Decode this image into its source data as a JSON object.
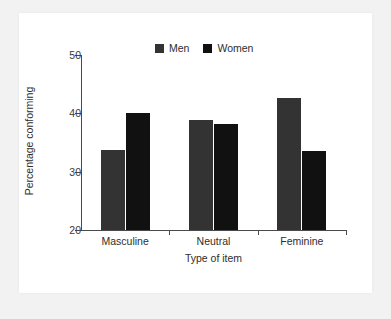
{
  "chart_data": {
    "type": "bar",
    "title": "",
    "xlabel": "Type of item",
    "ylabel": "Percentage conforming",
    "categories": [
      "Masculine",
      "Neutral",
      "Feminine"
    ],
    "series": [
      {
        "name": "Men",
        "color": "#333333",
        "values": [
          33.7,
          38.9,
          42.6
        ]
      },
      {
        "name": "Women",
        "color": "#111111",
        "values": [
          40.0,
          38.1,
          33.5
        ]
      }
    ],
    "ylim": [
      20,
      50
    ],
    "yticks": [
      20,
      30,
      40,
      50
    ],
    "ytick_labels": [
      "20",
      "30",
      "40",
      "50"
    ],
    "grid": false,
    "legend_position": "top-center"
  },
  "legend": {
    "entries": [
      {
        "label": "Men",
        "swatch": "men-swatch"
      },
      {
        "label": "Women",
        "swatch": "women-swatch"
      }
    ]
  },
  "colors": {
    "men": "#333333",
    "women": "#111111",
    "axis": "#4a4a4a",
    "text": "#2e2e2e",
    "panel": "#ffffff",
    "outer": "#f2f2f2"
  }
}
